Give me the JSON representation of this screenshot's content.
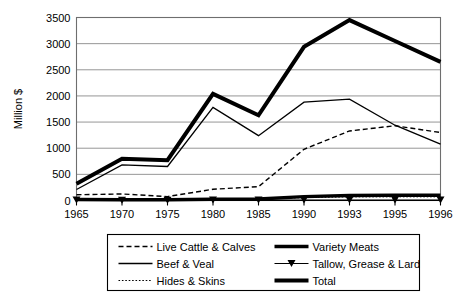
{
  "chart_data": {
    "type": "line",
    "title": "",
    "xlabel": "",
    "ylabel": "Million $",
    "categories": [
      "1965",
      "1970",
      "1975",
      "1980",
      "1985",
      "1990",
      "1993",
      "1995",
      "1996"
    ],
    "x_tick_labels": [
      "1965",
      "1970",
      "1975",
      "1980",
      "1985",
      "1990",
      "1993",
      "1995",
      "1996"
    ],
    "y_tick_labels": [
      "0",
      "500",
      "1000",
      "1500",
      "2000",
      "2500",
      "3000",
      "3500"
    ],
    "y_ticks": [
      0,
      500,
      1000,
      1500,
      2000,
      2500,
      3000,
      3500
    ],
    "ylim": [
      0,
      3500
    ],
    "grid": "horizontal",
    "legend_position": "below-plot",
    "series": [
      {
        "name": "Live Cattle & Calves",
        "style": "dashed",
        "width": 1.4,
        "marker": "none",
        "values": [
          110,
          125,
          75,
          215,
          265,
          980,
          1330,
          1430,
          1300
        ]
      },
      {
        "name": "Beef & Veal",
        "style": "solid",
        "width": 1.3,
        "marker": "none",
        "values": [
          210,
          680,
          650,
          1780,
          1240,
          1880,
          1940,
          1440,
          1080
        ]
      },
      {
        "name": "Hides & Skins",
        "style": "dotted",
        "width": 1.0,
        "marker": "none",
        "values": [
          25,
          20,
          20,
          25,
          30,
          55,
          70,
          70,
          70
        ]
      },
      {
        "name": "Variety Meats",
        "style": "solid",
        "width": 3.4,
        "marker": "none",
        "values": [
          20,
          15,
          15,
          25,
          30,
          75,
          95,
          100,
          100
        ]
      },
      {
        "name": "Tallow, Grease & Lard",
        "style": "solid",
        "width": 1.0,
        "marker": "triangle-down",
        "values": [
          8,
          6,
          6,
          8,
          8,
          10,
          10,
          10,
          10
        ]
      },
      {
        "name": "Total",
        "style": "solid",
        "width": 4.0,
        "marker": "none",
        "values": [
          320,
          800,
          770,
          2040,
          1630,
          2940,
          3450,
          3050,
          2650
        ]
      }
    ],
    "legend": [
      {
        "label": "Live Cattle & Calves",
        "style": "dashed",
        "width": 1.4,
        "marker": "none",
        "column": 0,
        "row": 0
      },
      {
        "label": "Beef & Veal",
        "style": "solid",
        "width": 1.3,
        "marker": "none",
        "column": 0,
        "row": 1
      },
      {
        "label": "Hides & Skins",
        "style": "dotted",
        "width": 1.0,
        "marker": "none",
        "column": 0,
        "row": 2
      },
      {
        "label": "Variety Meats",
        "style": "solid",
        "width": 3.4,
        "marker": "none",
        "column": 1,
        "row": 0
      },
      {
        "label": "Tallow, Grease & Lard",
        "style": "solid",
        "width": 1.0,
        "marker": "triangle-down",
        "column": 1,
        "row": 1
      },
      {
        "label": "Total",
        "style": "solid",
        "width": 4.0,
        "marker": "none",
        "column": 1,
        "row": 2
      }
    ],
    "colors": {
      "line": "#000000",
      "grid": "#8a8a8a",
      "frame": "#6e6e6e",
      "background": "#ffffff"
    }
  }
}
